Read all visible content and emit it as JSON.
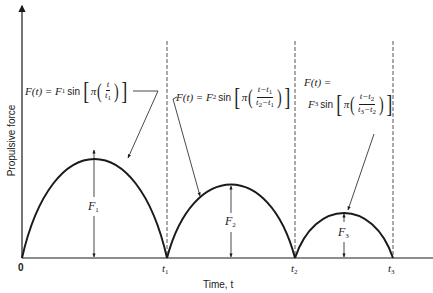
{
  "diagram": {
    "axes": {
      "x_label": "Time, t",
      "y_label": "Propulsive force",
      "origin_label": "0"
    },
    "ticks": [
      {
        "symbol": "t",
        "sub": "1"
      },
      {
        "symbol": "t",
        "sub": "2"
      },
      {
        "symbol": "t",
        "sub": "3"
      }
    ],
    "arches": [
      {
        "amplitude_label": "F",
        "amplitude_sub": "1",
        "equation": {
          "lhs": "F(t) =",
          "coef": "F",
          "coef_sub": "1",
          "func": "sin",
          "pi": "π",
          "num": "t",
          "num_sub": "",
          "den": "t",
          "den_sub": "1"
        }
      },
      {
        "amplitude_label": "F",
        "amplitude_sub": "2",
        "equation": {
          "lhs": "F(t) =",
          "coef": "F",
          "coef_sub": "2",
          "func": "sin",
          "pi": "π",
          "num": "t−t",
          "num_sub": "1",
          "den": "t",
          "den_sub": "2",
          "den_tail": "−t",
          "den_tail_sub": "1"
        }
      },
      {
        "amplitude_label": "F",
        "amplitude_sub": "3",
        "equation": {
          "lhs": "F(t) =",
          "coef": "F",
          "coef_sub": "3",
          "func": "sin",
          "pi": "π",
          "num": "t−t",
          "num_sub": "2",
          "den": "t",
          "den_sub": "3",
          "den_tail": "−t",
          "den_tail_sub": "2"
        }
      }
    ],
    "colors": {
      "ink": "#1a1a1a",
      "background": "#ffffff",
      "dashed": "#555555"
    }
  }
}
